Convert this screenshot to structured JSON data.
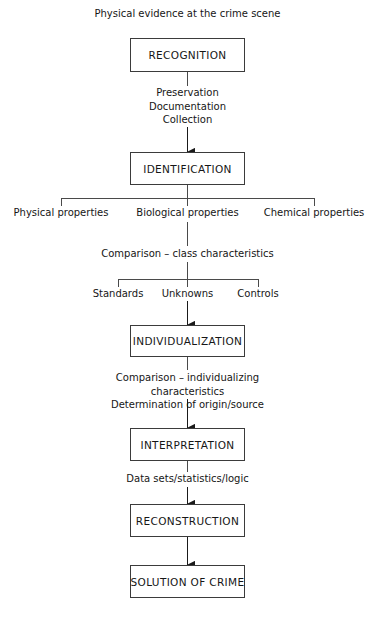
{
  "diagram": {
    "title": "Physical evidence at the crime scene",
    "stroke_color": "#3b3b3b",
    "text_color": "#161616",
    "background": "#ffffff",
    "nodes": [
      {
        "id": "recognition",
        "label": "RECOGNITION"
      },
      {
        "id": "identification",
        "label": "IDENTIFICATION"
      },
      {
        "id": "individualization",
        "label": "INDIVIDUALIZATION"
      },
      {
        "id": "interpretation",
        "label": "INTERPRETATION"
      },
      {
        "id": "reconstruction",
        "label": "RECONSTRUCTION"
      },
      {
        "id": "solution",
        "label": "SOLUTION OF CRIME"
      }
    ],
    "connectors": [
      {
        "id": "preservation-block",
        "text": "Preservation\nDocumentation\nCollection"
      },
      {
        "id": "comparison-class",
        "text": "Comparison – class characteristics"
      },
      {
        "id": "comparison-individualizing",
        "text": "Comparison – individualizing characteristics\nDetermination of origin/source"
      },
      {
        "id": "data-sets",
        "text": "Data sets/statistics/logic"
      }
    ],
    "branches": {
      "properties": [
        {
          "id": "physical",
          "label": "Physical properties"
        },
        {
          "id": "biological",
          "label": "Biological properties"
        },
        {
          "id": "chemical",
          "label": "Chemical properties"
        }
      ],
      "samples": [
        {
          "id": "standards",
          "label": "Standards"
        },
        {
          "id": "unknowns",
          "label": "Unknowns"
        },
        {
          "id": "controls",
          "label": "Controls"
        }
      ]
    }
  }
}
